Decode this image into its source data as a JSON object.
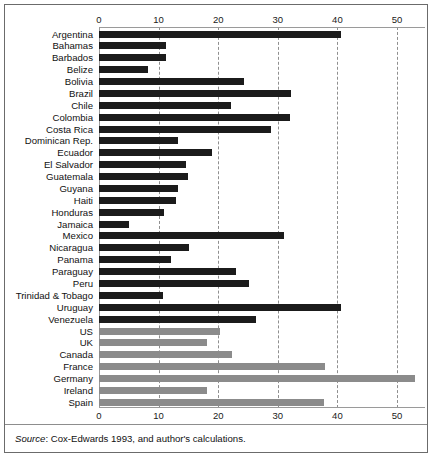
{
  "figure": {
    "source_prefix": "Source",
    "source_text": ": Cox-Edwards 1993, and author's calculations."
  },
  "colors": {
    "latin_america_bar": "#1b1b1b",
    "comparator_bar": "#8b8b8b",
    "gridline": "#8f8f8f",
    "frame": "#6b6b6b"
  },
  "chart_data": {
    "type": "bar",
    "orientation": "horizontal",
    "title": "",
    "xlabel": "",
    "ylabel": "",
    "xlim": [
      0,
      55
    ],
    "ticks": [
      0,
      10,
      20,
      30,
      40,
      50
    ],
    "tick_labels": [
      "0",
      "10",
      "20",
      "30",
      "40",
      "50"
    ],
    "grid": true,
    "axis_top": true,
    "axis_bottom": true,
    "legend": "none",
    "categories": [
      "Argentina",
      "Bahamas",
      "Barbados",
      "Belize",
      "Bolivia",
      "Brazil",
      "Chile",
      "Colombia",
      "Costa Rica",
      "Dominican Rep.",
      "Ecuador",
      "El Salvador",
      "Guatemala",
      "Guyana",
      "Haiti",
      "Honduras",
      "Jamaica",
      "Mexico",
      "Nicaragua",
      "Panama",
      "Paraguay",
      "Peru",
      "Trinidad & Tobago",
      "Uruguay",
      "Venezuela",
      "US",
      "UK",
      "Canada",
      "France",
      "Germany",
      "Ireland",
      "Spain"
    ],
    "values": [
      40.6,
      11.2,
      11.2,
      8.2,
      24.3,
      32.2,
      22.1,
      32.0,
      28.8,
      13.2,
      18.9,
      14.6,
      14.9,
      13.2,
      12.9,
      10.9,
      5.0,
      31.0,
      15.1,
      12.1,
      23.0,
      25.1,
      10.7,
      40.6,
      26.3,
      20.3,
      18.1,
      22.3,
      37.9,
      53.1,
      18.1,
      37.7
    ],
    "groups": [
      "latin_america",
      "latin_america",
      "latin_america",
      "latin_america",
      "latin_america",
      "latin_america",
      "latin_america",
      "latin_america",
      "latin_america",
      "latin_america",
      "latin_america",
      "latin_america",
      "latin_america",
      "latin_america",
      "latin_america",
      "latin_america",
      "latin_america",
      "latin_america",
      "latin_america",
      "latin_america",
      "latin_america",
      "latin_america",
      "latin_america",
      "latin_america",
      "latin_america",
      "comparator",
      "comparator",
      "comparator",
      "comparator",
      "comparator",
      "comparator",
      "comparator"
    ]
  }
}
